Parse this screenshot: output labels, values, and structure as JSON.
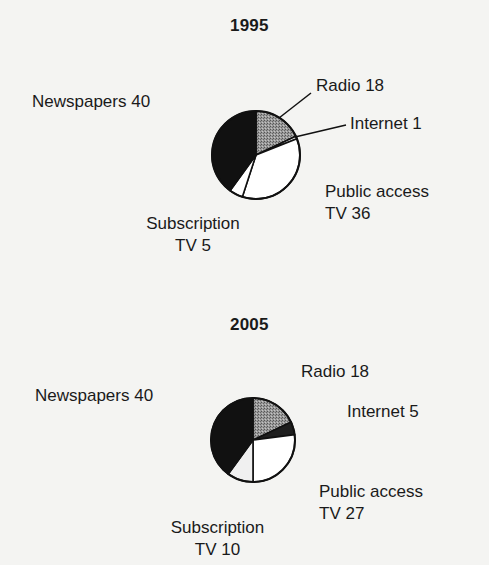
{
  "chart_data": [
    {
      "type": "pie",
      "title": "1995",
      "categories": [
        "Radio",
        "Internet",
        "Public access TV",
        "Subscription TV",
        "Newspapers"
      ],
      "values": [
        18,
        1,
        36,
        5,
        40
      ],
      "labels": {
        "radio": "Radio 18",
        "internet": "Internet 1",
        "public_access_line1": "Public access",
        "public_access_line2": "TV 36",
        "subscription_line1": "Subscription",
        "subscription_line2": "TV 5",
        "newspapers": "Newspapers 40"
      },
      "start_angle_deg": 0,
      "direction": "clockwise",
      "fills": {
        "Radio": "#8a8a8a",
        "Internet": "#ffffff",
        "Public access TV": "#ffffff",
        "Subscription TV": "#ffffff",
        "Newspapers": "#111111"
      },
      "leader_lines": [
        "Radio",
        "Internet"
      ]
    },
    {
      "type": "pie",
      "title": "2005",
      "categories": [
        "Radio",
        "Internet",
        "Public access TV",
        "Subscription TV",
        "Newspapers"
      ],
      "values": [
        18,
        5,
        27,
        10,
        40
      ],
      "labels": {
        "radio": "Radio 18",
        "internet": "Internet 5",
        "public_access_line1": "Public access",
        "public_access_line2": "TV 27",
        "subscription_line1": "Subscription",
        "subscription_line2": "TV 10",
        "newspapers": "Newspapers 40"
      },
      "start_angle_deg": 0,
      "direction": "clockwise",
      "fills": {
        "Radio": "#8a8a8a",
        "Internet": "#1e1e1e",
        "Public access TV": "#ffffff",
        "Subscription TV": "#f0f0f0",
        "Newspapers": "#111111"
      },
      "leader_lines": []
    }
  ]
}
